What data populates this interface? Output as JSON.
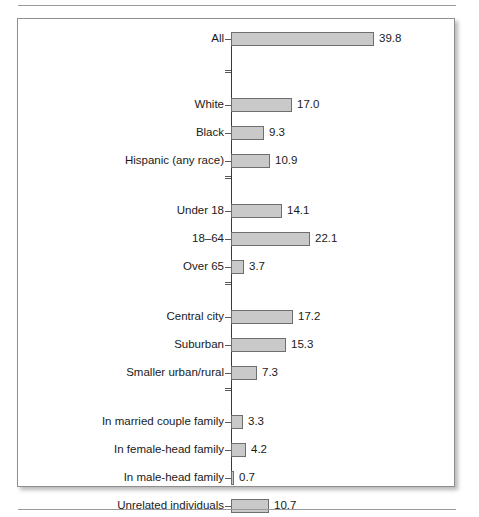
{
  "figure": {
    "frame_border_color": "#8f8f8f",
    "background_color": "#ffffff",
    "rule_color": "#9a9a9a"
  },
  "chart_data": {
    "type": "bar",
    "orientation": "horizontal",
    "title": "",
    "subtitle": "",
    "xlabel": "",
    "ylabel": "",
    "grid": false,
    "legend": false,
    "axis_line": true,
    "xlim": [
      0,
      39.8
    ],
    "bar_fill_color": "#c9c9c9",
    "bar_edge_color": "#6e6e6e",
    "value_label_format": "one-decimal",
    "categories": [
      "All",
      "White",
      "Black",
      "Hispanic (any race)",
      "Under 18",
      "18–64",
      "Over 65",
      "Central city",
      "Suburban",
      "Smaller urban/rural",
      "In married couple family",
      "In female-head family",
      "In male-head family",
      "Unrelated individuals"
    ],
    "values": [
      39.8,
      17.0,
      9.3,
      10.9,
      14.1,
      22.1,
      3.7,
      17.2,
      15.3,
      7.3,
      3.3,
      4.2,
      0.7,
      10.7
    ],
    "value_labels": [
      "39.8",
      "17.0",
      "9.3",
      "10.9",
      "14.1",
      "22.1",
      "3.7",
      "17.2",
      "15.3",
      "7.3",
      "3.3",
      "4.2",
      "0.7",
      "10.7"
    ],
    "groups": [
      {
        "name": "total",
        "categories": [
          "All"
        ]
      },
      {
        "name": "race",
        "categories": [
          "White",
          "Black",
          "Hispanic (any race)"
        ]
      },
      {
        "name": "age",
        "categories": [
          "Under 18",
          "18–64",
          "Over 65"
        ]
      },
      {
        "name": "residence",
        "categories": [
          "Central city",
          "Suburban",
          "Smaller urban/rural"
        ]
      },
      {
        "name": "household",
        "categories": [
          "In married couple family",
          "In female-head family",
          "In male-head family",
          "Unrelated individuals"
        ]
      }
    ],
    "rows": [
      {
        "label": "All",
        "value": 39.8,
        "value_label": "39.8",
        "top": 13,
        "group": "total"
      },
      {
        "label": "White",
        "value": 17.0,
        "value_label": "17.0",
        "top": 79,
        "group": "race"
      },
      {
        "label": "Black",
        "value": 9.3,
        "value_label": "9.3",
        "top": 107,
        "group": "race"
      },
      {
        "label": "Hispanic (any race)",
        "value": 10.9,
        "value_label": "10.9",
        "top": 135,
        "group": "race"
      },
      {
        "label": "Under 18",
        "value": 14.1,
        "value_label": "14.1",
        "top": 185,
        "group": "age"
      },
      {
        "label": "18–64",
        "value": 22.1,
        "value_label": "22.1",
        "top": 213,
        "group": "age"
      },
      {
        "label": "Over 65",
        "value": 3.7,
        "value_label": "3.7",
        "top": 241,
        "group": "age"
      },
      {
        "label": "Central city",
        "value": 17.2,
        "value_label": "17.2",
        "top": 291,
        "group": "residence"
      },
      {
        "label": "Suburban",
        "value": 15.3,
        "value_label": "15.3",
        "top": 319,
        "group": "residence"
      },
      {
        "label": "Smaller urban/rural",
        "value": 7.3,
        "value_label": "7.3",
        "top": 347,
        "group": "residence"
      },
      {
        "label": "In married couple family",
        "value": 3.3,
        "value_label": "3.3",
        "top": 396,
        "group": "household"
      },
      {
        "label": "In female-head family",
        "value": 4.2,
        "value_label": "4.2",
        "top": 424,
        "group": "household"
      },
      {
        "label": "In male-head family",
        "value": 0.7,
        "value_label": "0.7",
        "top": 452,
        "group": "household"
      },
      {
        "label": "Unrelated individuals",
        "value": 10.7,
        "value_label": "10.7",
        "top": 480,
        "group": "household"
      }
    ]
  }
}
